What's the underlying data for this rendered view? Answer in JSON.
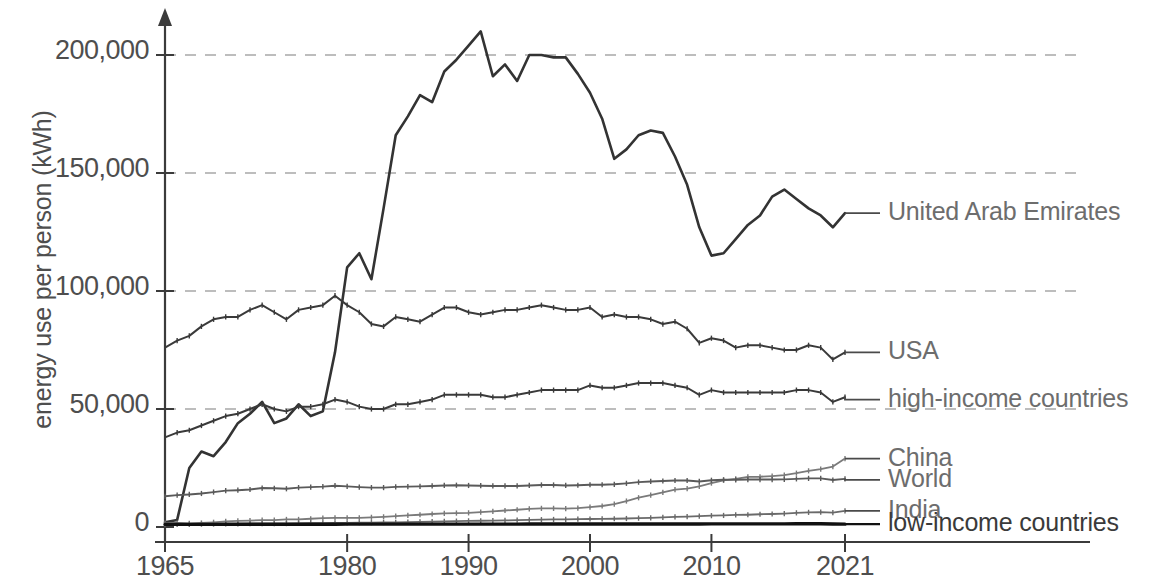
{
  "chart_data": {
    "type": "line",
    "title": "",
    "xlabel": "",
    "ylabel": "energy use per person (kWh)",
    "xlim": [
      1965,
      2021
    ],
    "ylim": [
      0,
      215000
    ],
    "grid": true,
    "grid_axis": "y",
    "legend_position": "right-inline-labels",
    "y_ticks": [
      0,
      50000,
      100000,
      150000,
      200000
    ],
    "y_tick_labels": [
      "0",
      "50,000",
      "100,000",
      "150,000",
      "200,000"
    ],
    "x_ticks": [
      1965,
      1980,
      1990,
      2000,
      2010,
      2021
    ],
    "x_tick_labels": [
      "1965",
      "1980",
      "1990",
      "2000",
      "2010",
      "2021"
    ],
    "x": [
      1965,
      1966,
      1967,
      1968,
      1969,
      1970,
      1971,
      1972,
      1973,
      1974,
      1975,
      1976,
      1977,
      1978,
      1979,
      1980,
      1981,
      1982,
      1983,
      1984,
      1985,
      1986,
      1987,
      1988,
      1989,
      1990,
      1991,
      1992,
      1993,
      1994,
      1995,
      1996,
      1997,
      1998,
      1999,
      2000,
      2001,
      2002,
      2003,
      2004,
      2005,
      2006,
      2007,
      2008,
      2009,
      2010,
      2011,
      2012,
      2013,
      2014,
      2015,
      2016,
      2017,
      2018,
      2019,
      2020,
      2021
    ],
    "series": [
      {
        "name": "United Arab Emirates",
        "color": "#333333",
        "width": 2.6,
        "markers": false,
        "label_y_value": 133000,
        "values": [
          2000,
          3000,
          25000,
          32000,
          30000,
          36000,
          44000,
          48000,
          53000,
          44000,
          46000,
          52000,
          47000,
          49000,
          74000,
          110000,
          116000,
          105000,
          135000,
          166000,
          174000,
          183000,
          180000,
          193000,
          198000,
          204000,
          210000,
          191000,
          196000,
          189000,
          200000,
          200000,
          199000,
          199000,
          192000,
          184000,
          173000,
          156000,
          160000,
          166000,
          168000,
          167000,
          157000,
          145000,
          127000,
          115000,
          116000,
          122000,
          128000,
          132000,
          140000,
          143000,
          139000,
          135000,
          132000,
          127000,
          133000
        ]
      },
      {
        "name": "USA",
        "color": "#3a3a3a",
        "width": 2.0,
        "markers": true,
        "label_y_value": 74000,
        "values": [
          76000,
          79000,
          81000,
          85000,
          88000,
          89000,
          89000,
          92000,
          94000,
          91000,
          88000,
          92000,
          93000,
          94000,
          98000,
          94000,
          91000,
          86000,
          85000,
          89000,
          88000,
          87000,
          90000,
          93000,
          93000,
          91000,
          90000,
          91000,
          92000,
          92000,
          93000,
          94000,
          93000,
          92000,
          92000,
          93000,
          89000,
          90000,
          89000,
          89000,
          88000,
          86000,
          87000,
          84000,
          78000,
          80000,
          79000,
          76000,
          77000,
          77000,
          76000,
          75000,
          75000,
          77000,
          76000,
          71000,
          74000
        ]
      },
      {
        "name": "high-income countries",
        "color": "#3a3a3a",
        "width": 2.0,
        "markers": true,
        "label_y_value": 54000,
        "values": [
          38000,
          40000,
          41000,
          43000,
          45000,
          47000,
          48000,
          50000,
          52000,
          50000,
          49000,
          51000,
          51000,
          52000,
          54000,
          53000,
          51000,
          50000,
          50000,
          52000,
          52000,
          53000,
          54000,
          56000,
          56000,
          56000,
          56000,
          55000,
          55000,
          56000,
          57000,
          58000,
          58000,
          58000,
          58000,
          60000,
          59000,
          59000,
          60000,
          61000,
          61000,
          61000,
          60000,
          59000,
          56000,
          58000,
          57000,
          57000,
          57000,
          57000,
          57000,
          57000,
          58000,
          58000,
          57000,
          53000,
          55000
        ]
      },
      {
        "name": "China",
        "color": "#7a7a7a",
        "width": 1.8,
        "markers": true,
        "label_y_value": 29000,
        "values": [
          1600,
          1700,
          1500,
          1700,
          2000,
          2400,
          2600,
          2700,
          2900,
          2900,
          3200,
          3200,
          3500,
          3800,
          3900,
          3900,
          3900,
          4100,
          4300,
          4600,
          4900,
          5200,
          5500,
          5800,
          5900,
          6000,
          6300,
          6600,
          7000,
          7300,
          7700,
          7900,
          7900,
          7800,
          8000,
          8400,
          8900,
          9700,
          11000,
          12400,
          13500,
          14700,
          15800,
          16300,
          17200,
          18600,
          19800,
          20400,
          21200,
          21300,
          21600,
          22000,
          22800,
          23800,
          24500,
          25600,
          29000
        ]
      },
      {
        "name": "World",
        "color": "#5a5a5a",
        "width": 1.9,
        "markers": true,
        "label_y_value": 20000,
        "values": [
          13000,
          13500,
          13800,
          14200,
          14800,
          15400,
          15600,
          15900,
          16500,
          16400,
          16200,
          16700,
          16900,
          17100,
          17500,
          17200,
          16900,
          16700,
          16700,
          17000,
          17100,
          17200,
          17400,
          17600,
          17700,
          17600,
          17500,
          17400,
          17400,
          17400,
          17600,
          17800,
          17800,
          17600,
          17700,
          17900,
          17900,
          18100,
          18500,
          19000,
          19300,
          19500,
          19700,
          19700,
          19300,
          19800,
          20000,
          20000,
          20100,
          20100,
          20100,
          20200,
          20400,
          20600,
          20600,
          19900,
          20400
        ]
      },
      {
        "name": "India",
        "color": "#6a6a6a",
        "width": 1.8,
        "markers": true,
        "label_y_value": 6800,
        "values": [
          1100,
          1150,
          1150,
          1200,
          1250,
          1300,
          1350,
          1400,
          1400,
          1400,
          1450,
          1550,
          1600,
          1650,
          1700,
          1700,
          1800,
          1850,
          1900,
          2000,
          2100,
          2200,
          2300,
          2400,
          2500,
          2600,
          2650,
          2700,
          2800,
          2900,
          3000,
          3100,
          3200,
          3250,
          3350,
          3400,
          3450,
          3500,
          3600,
          3750,
          3900,
          4100,
          4300,
          4400,
          4600,
          4800,
          4900,
          5100,
          5200,
          5400,
          5500,
          5700,
          6000,
          6200,
          6300,
          6100,
          6800
        ]
      },
      {
        "name": "low-income countries",
        "color": "#111111",
        "width": 3.4,
        "markers": false,
        "label_y_value": 1200,
        "values": [
          1100,
          1100,
          1100,
          1100,
          1100,
          1150,
          1150,
          1150,
          1150,
          1150,
          1150,
          1180,
          1180,
          1180,
          1180,
          1200,
          1200,
          1200,
          1200,
          1200,
          1200,
          1200,
          1200,
          1200,
          1200,
          1200,
          1200,
          1200,
          1200,
          1200,
          1250,
          1250,
          1250,
          1250,
          1250,
          1250,
          1250,
          1250,
          1250,
          1280,
          1280,
          1280,
          1300,
          1300,
          1300,
          1320,
          1320,
          1320,
          1330,
          1330,
          1340,
          1340,
          1350,
          1350,
          1350,
          1300,
          1200
        ]
      }
    ]
  },
  "axis_style": {
    "axis_color": "#3b3b3b",
    "grid_color": "#a8a8a8",
    "text_color": "#4e4e4e",
    "label_color": "#6d6d6d"
  }
}
